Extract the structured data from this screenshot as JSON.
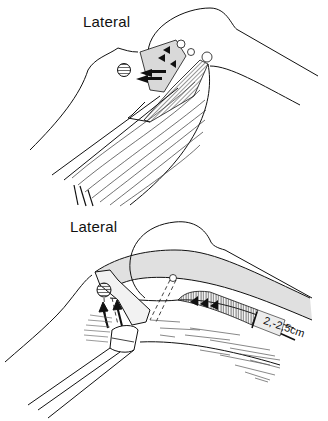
{
  "figure": {
    "panels": [
      {
        "id": "top",
        "label": "Lateral",
        "description": "Flexed elbow/shoulder region with tendon insertion, arrows indicating pull direction"
      },
      {
        "id": "bottom",
        "label": "Lateral",
        "description": "Extended arm view showing tendon slip with hatched region and measurement",
        "measurement": "2,-2,5cm"
      }
    ],
    "colors": {
      "line": "#111111",
      "shade": "#d9d9d9",
      "background": "#ffffff"
    }
  }
}
